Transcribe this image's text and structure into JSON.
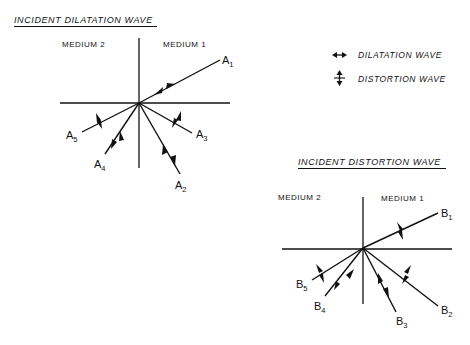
{
  "diagram_a": {
    "title": "INCIDENT  DILATATION WAVE",
    "medium_left": "MEDIUM 2",
    "medium_right": "MEDIUM 1",
    "origin": [
      139,
      103
    ],
    "rays": [
      {
        "id": "A1",
        "label": "A",
        "sub": "1",
        "end": [
          220,
          60
        ],
        "wave": "dilatation"
      },
      {
        "id": "A2",
        "label": "A",
        "sub": "2",
        "end": [
          180,
          174
        ],
        "wave": "dilatation"
      },
      {
        "id": "A3",
        "label": "A",
        "sub": "3",
        "end": [
          192,
          133
        ],
        "wave": "distortion"
      },
      {
        "id": "A4",
        "label": "A",
        "sub": "4",
        "end": [
          105,
          154
        ],
        "wave": "dilatation"
      },
      {
        "id": "A5",
        "label": "A",
        "sub": "5",
        "end": [
          82,
          132
        ],
        "wave": "distortion"
      }
    ]
  },
  "diagram_b": {
    "title": "INCIDENT DISTORTION WAVE",
    "medium_left": "MEDIUM 2",
    "medium_right": "MEDIUM 1",
    "origin": [
      363,
      248
    ],
    "rays": [
      {
        "id": "B1",
        "label": "B",
        "sub": "1",
        "end": [
          438,
          213
        ],
        "wave": "distortion"
      },
      {
        "id": "B2",
        "label": "B",
        "sub": "2",
        "end": [
          438,
          306
        ],
        "wave": "distortion"
      },
      {
        "id": "B3",
        "label": "B",
        "sub": "3",
        "end": [
          396,
          312
        ],
        "wave": "dilatation"
      },
      {
        "id": "B4",
        "label": "B",
        "sub": "4",
        "end": [
          325,
          296
        ],
        "wave": "dilatation"
      },
      {
        "id": "B5",
        "label": "B",
        "sub": "5",
        "end": [
          312,
          280
        ],
        "wave": "distortion"
      }
    ]
  },
  "legend": {
    "dilatation": "DILATATION WAVE",
    "distortion": "DISTORTION WAVE"
  },
  "colors": {
    "ink": "#111111",
    "background": "#ffffff"
  }
}
